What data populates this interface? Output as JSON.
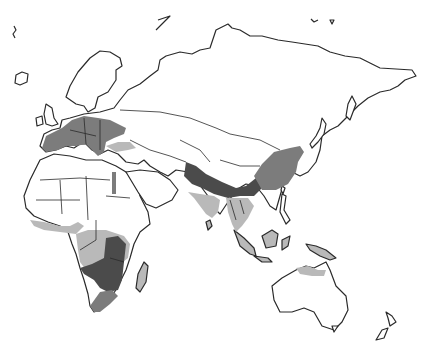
{
  "map": {
    "type": "distribution-map",
    "region": "Europe, Africa, Asia, Australia",
    "shading": {
      "dark": "#4b4b4b",
      "mid": "#7c7c7c",
      "light": "#b9b9b9",
      "outline": "#2a2a2a",
      "background": "#ffffff"
    },
    "zones": [
      {
        "name": "Europe",
        "shade": "mid"
      },
      {
        "name": "Anatolia",
        "shade": "light"
      },
      {
        "name": "Nile valley",
        "shade": "mid"
      },
      {
        "name": "West Africa coast",
        "shade": "light"
      },
      {
        "name": "Central Africa",
        "shade": "light"
      },
      {
        "name": "Southern-central Africa",
        "shade": "dark"
      },
      {
        "name": "South Africa",
        "shade": "mid"
      },
      {
        "name": "Madagascar",
        "shade": "light"
      },
      {
        "name": "Himalaya / South China",
        "shade": "dark"
      },
      {
        "name": "Eastern China / Korea",
        "shade": "mid"
      },
      {
        "name": "India",
        "shade": "light"
      },
      {
        "name": "Southeast Asia",
        "shade": "light"
      },
      {
        "name": "Indonesia",
        "shade": "light"
      },
      {
        "name": "Northern Australia",
        "shade": "light"
      }
    ]
  }
}
